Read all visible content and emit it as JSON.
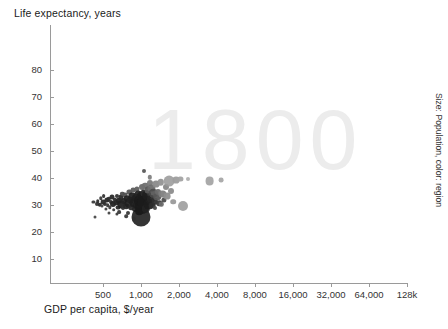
{
  "chart_data": {
    "type": "scatter",
    "title": "",
    "watermark": "1800",
    "ylabel": "Life expectancy, years",
    "xlabel": "GDP per capita, $/year",
    "size_legend": "Size: Population, color: region",
    "xscale": "log",
    "xlim": [
      300,
      160000
    ],
    "ylim": [
      0,
      88
    ],
    "grid": false,
    "legend_position": "none",
    "xticks": [
      {
        "value": 500,
        "label": "500"
      },
      {
        "value": 1000,
        "label": "1,000"
      },
      {
        "value": 2000,
        "label": "2,000"
      },
      {
        "value": 4000,
        "label": "4,000"
      },
      {
        "value": 8000,
        "label": "8,000"
      },
      {
        "value": 16000,
        "label": "16,000"
      },
      {
        "value": 32000,
        "label": "32,000"
      },
      {
        "value": 64000,
        "label": "64,000"
      },
      {
        "value": 128000,
        "label": "128k"
      }
    ],
    "yticks": [
      {
        "value": 10,
        "label": "10"
      },
      {
        "value": 20,
        "label": "20"
      },
      {
        "value": 30,
        "label": "30"
      },
      {
        "value": 40,
        "label": "40"
      },
      {
        "value": 50,
        "label": "50"
      },
      {
        "value": 60,
        "label": "60"
      },
      {
        "value": 70,
        "label": "70"
      },
      {
        "value": 80,
        "label": "80"
      }
    ],
    "colors": {
      "axis": "#9a9a9a",
      "text": "#1a1a1a",
      "watermark": "#ececec",
      "bubble_dark": "#2b2b2b",
      "bubble_mid": "#5d5d5d",
      "bubble_light": "#9d9d9d",
      "bubble_pale": "#bdbdbd"
    },
    "points": [
      {
        "x": 420,
        "y": 31.0,
        "r": 1.6,
        "c": "#3a3a3a"
      },
      {
        "x": 430,
        "y": 25.5,
        "r": 1.5,
        "c": "#4a4a4a"
      },
      {
        "x": 445,
        "y": 30.2,
        "r": 2.0,
        "c": "#333333"
      },
      {
        "x": 455,
        "y": 31.5,
        "r": 1.8,
        "c": "#2f2f2f"
      },
      {
        "x": 470,
        "y": 30.0,
        "r": 2.2,
        "c": "#2b2b2b"
      },
      {
        "x": 480,
        "y": 32.5,
        "r": 1.7,
        "c": "#3c3c3c"
      },
      {
        "x": 490,
        "y": 29.5,
        "r": 1.5,
        "c": "#444444"
      },
      {
        "x": 500,
        "y": 31.0,
        "r": 2.4,
        "c": "#2a2a2a"
      },
      {
        "x": 505,
        "y": 33.3,
        "r": 1.9,
        "c": "#353535"
      },
      {
        "x": 515,
        "y": 30.5,
        "r": 2.1,
        "c": "#2e2e2e"
      },
      {
        "x": 525,
        "y": 28.6,
        "r": 1.6,
        "c": "#414141"
      },
      {
        "x": 535,
        "y": 31.8,
        "r": 2.6,
        "c": "#272727"
      },
      {
        "x": 545,
        "y": 30.0,
        "r": 1.8,
        "c": "#383838"
      },
      {
        "x": 555,
        "y": 32.2,
        "r": 2.3,
        "c": "#2c2c2c"
      },
      {
        "x": 565,
        "y": 29.2,
        "r": 1.7,
        "c": "#3e3e3e"
      },
      {
        "x": 575,
        "y": 31.2,
        "r": 2.0,
        "c": "#303030"
      },
      {
        "x": 585,
        "y": 33.0,
        "r": 2.5,
        "c": "#292929"
      },
      {
        "x": 600,
        "y": 30.4,
        "r": 3.0,
        "c": "#252525"
      },
      {
        "x": 610,
        "y": 28.2,
        "r": 1.8,
        "c": "#3b3b3b"
      },
      {
        "x": 620,
        "y": 32.0,
        "r": 2.2,
        "c": "#2d2d2d"
      },
      {
        "x": 635,
        "y": 30.8,
        "r": 2.8,
        "c": "#262626"
      },
      {
        "x": 645,
        "y": 33.5,
        "r": 2.0,
        "c": "#343434"
      },
      {
        "x": 655,
        "y": 29.0,
        "r": 2.4,
        "c": "#2b2b2b"
      },
      {
        "x": 665,
        "y": 31.6,
        "r": 3.2,
        "c": "#232323"
      },
      {
        "x": 675,
        "y": 27.5,
        "r": 1.9,
        "c": "#3a3a3a"
      },
      {
        "x": 690,
        "y": 32.8,
        "r": 2.6,
        "c": "#282828"
      },
      {
        "x": 700,
        "y": 30.2,
        "r": 3.6,
        "c": "#222222"
      },
      {
        "x": 710,
        "y": 34.2,
        "r": 2.2,
        "c": "#4e4e4e"
      },
      {
        "x": 720,
        "y": 28.8,
        "r": 2.0,
        "c": "#343434"
      },
      {
        "x": 735,
        "y": 31.4,
        "r": 3.0,
        "c": "#252525"
      },
      {
        "x": 745,
        "y": 33.8,
        "r": 2.4,
        "c": "#505050"
      },
      {
        "x": 760,
        "y": 29.6,
        "r": 2.8,
        "c": "#282828"
      },
      {
        "x": 775,
        "y": 32.4,
        "r": 3.4,
        "c": "#232323"
      },
      {
        "x": 785,
        "y": 27.0,
        "r": 2.0,
        "c": "#383838"
      },
      {
        "x": 800,
        "y": 30.6,
        "r": 4.2,
        "c": "#1f1f1f"
      },
      {
        "x": 810,
        "y": 34.8,
        "r": 2.6,
        "c": "#565656"
      },
      {
        "x": 825,
        "y": 31.8,
        "r": 3.2,
        "c": "#242424"
      },
      {
        "x": 840,
        "y": 29.2,
        "r": 2.8,
        "c": "#2a2a2a"
      },
      {
        "x": 855,
        "y": 33.2,
        "r": 3.6,
        "c": "#222222"
      },
      {
        "x": 865,
        "y": 35.5,
        "r": 2.4,
        "c": "#5c5c5c"
      },
      {
        "x": 880,
        "y": 30.8,
        "r": 4.6,
        "c": "#1e1e1e"
      },
      {
        "x": 895,
        "y": 28.4,
        "r": 3.0,
        "c": "#272727"
      },
      {
        "x": 910,
        "y": 32.6,
        "r": 4.0,
        "c": "#202020"
      },
      {
        "x": 925,
        "y": 36.0,
        "r": 2.6,
        "c": "#606060"
      },
      {
        "x": 940,
        "y": 30.0,
        "r": 5.2,
        "c": "#1c1c1c"
      },
      {
        "x": 955,
        "y": 34.0,
        "r": 3.4,
        "c": "#252525"
      },
      {
        "x": 970,
        "y": 27.8,
        "r": 3.8,
        "c": "#212121"
      },
      {
        "x": 985,
        "y": 31.6,
        "r": 6.0,
        "c": "#1a1a1a"
      },
      {
        "x": 1000,
        "y": 33.4,
        "r": 4.4,
        "c": "#1e1e1e"
      },
      {
        "x": 1000,
        "y": 25.5,
        "r": 9.5,
        "c": "#191919"
      },
      {
        "x": 1010,
        "y": 36.5,
        "r": 3.0,
        "c": "#6a6a6a"
      },
      {
        "x": 1020,
        "y": 29.4,
        "r": 7.0,
        "c": "#1a1a1a"
      },
      {
        "x": 1035,
        "y": 32.8,
        "r": 5.0,
        "c": "#1d1d1d"
      },
      {
        "x": 1050,
        "y": 34.6,
        "r": 3.6,
        "c": "#2a2a2a"
      },
      {
        "x": 1065,
        "y": 31.0,
        "r": 6.5,
        "c": "#1b1b1b"
      },
      {
        "x": 1080,
        "y": 37.2,
        "r": 3.2,
        "c": "#707070"
      },
      {
        "x": 1095,
        "y": 28.6,
        "r": 4.2,
        "c": "#232323"
      },
      {
        "x": 1110,
        "y": 33.6,
        "r": 4.8,
        "c": "#1f1f1f"
      },
      {
        "x": 1130,
        "y": 35.4,
        "r": 3.4,
        "c": "#5a5a5a"
      },
      {
        "x": 1150,
        "y": 30.4,
        "r": 5.4,
        "c": "#1d1d1d"
      },
      {
        "x": 1170,
        "y": 38.0,
        "r": 3.0,
        "c": "#7a7a7a"
      },
      {
        "x": 1190,
        "y": 32.2,
        "r": 4.0,
        "c": "#242424"
      },
      {
        "x": 1210,
        "y": 36.2,
        "r": 3.6,
        "c": "#6e6e6e"
      },
      {
        "x": 1230,
        "y": 29.8,
        "r": 3.4,
        "c": "#2a2a2a"
      },
      {
        "x": 1255,
        "y": 34.4,
        "r": 4.2,
        "c": "#4a4a4a"
      },
      {
        "x": 1280,
        "y": 31.4,
        "r": 3.2,
        "c": "#2e2e2e"
      },
      {
        "x": 1310,
        "y": 37.6,
        "r": 3.4,
        "c": "#8a8a8a"
      },
      {
        "x": 1340,
        "y": 33.0,
        "r": 3.8,
        "c": "#565656"
      },
      {
        "x": 1370,
        "y": 35.0,
        "r": 3.0,
        "c": "#6c6c6c"
      },
      {
        "x": 1400,
        "y": 30.6,
        "r": 2.8,
        "c": "#3a3a3a"
      },
      {
        "x": 1440,
        "y": 38.4,
        "r": 3.2,
        "c": "#949494"
      },
      {
        "x": 1480,
        "y": 34.2,
        "r": 3.6,
        "c": "#7e7e7e"
      },
      {
        "x": 1520,
        "y": 32.0,
        "r": 2.6,
        "c": "#4c4c4c"
      },
      {
        "x": 1570,
        "y": 36.6,
        "r": 3.0,
        "c": "#888888"
      },
      {
        "x": 1620,
        "y": 33.4,
        "r": 3.4,
        "c": "#8e8e8e"
      },
      {
        "x": 1680,
        "y": 38.8,
        "r": 5.4,
        "c": "#9a9a9a"
      },
      {
        "x": 1740,
        "y": 35.2,
        "r": 3.0,
        "c": "#8c8c8c"
      },
      {
        "x": 1800,
        "y": 31.2,
        "r": 2.8,
        "c": "#9a9a9a"
      },
      {
        "x": 1900,
        "y": 39.2,
        "r": 3.4,
        "c": "#9d9d9d"
      },
      {
        "x": 1050,
        "y": 42.5,
        "r": 2.0,
        "c": "#585858"
      },
      {
        "x": 1180,
        "y": 40.2,
        "r": 2.2,
        "c": "#808080"
      },
      {
        "x": 2050,
        "y": 39.8,
        "r": 2.6,
        "c": "#a3a3a3"
      },
      {
        "x": 2150,
        "y": 29.6,
        "r": 5.0,
        "c": "#9b9b9b"
      },
      {
        "x": 2350,
        "y": 39.6,
        "r": 2.0,
        "c": "#b0b0b0"
      },
      {
        "x": 3500,
        "y": 38.8,
        "r": 4.4,
        "c": "#9e9e9e"
      },
      {
        "x": 4300,
        "y": 39.2,
        "r": 2.4,
        "c": "#a8a8a8"
      },
      {
        "x": 640,
        "y": 26.8,
        "r": 1.6,
        "c": "#3f3f3f"
      },
      {
        "x": 760,
        "y": 25.8,
        "r": 1.8,
        "c": "#3a3a3a"
      },
      {
        "x": 880,
        "y": 24.8,
        "r": 2.2,
        "c": "#303030"
      },
      {
        "x": 560,
        "y": 27.2,
        "r": 1.5,
        "c": "#454545"
      },
      {
        "x": 1300,
        "y": 28.8,
        "r": 2.0,
        "c": "#4a4a4a"
      },
      {
        "x": 1450,
        "y": 30.2,
        "r": 2.2,
        "c": "#6a6a6a"
      }
    ]
  }
}
